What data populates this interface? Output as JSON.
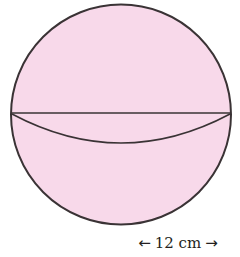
{
  "figure": {
    "shape": "sphere",
    "fill_color": "#f8d9ea",
    "stroke_color": "#3a3335",
    "circle": {
      "cx": 121,
      "cy": 114.5,
      "r": 110
    },
    "equator": {
      "y": 113,
      "lower_arc_depth": 29
    }
  },
  "dimension": {
    "label": "12 cm",
    "left_arrow": "←",
    "right_arrow": "→"
  }
}
